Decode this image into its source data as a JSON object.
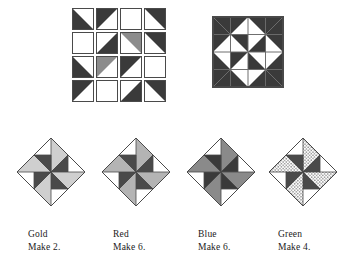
{
  "figure": {
    "type": "quilt-block-assembly-diagram",
    "colors": {
      "dark": "#3a3a3a",
      "mid_gray": "#8c8c8c",
      "light_gray": "#c9c9c9",
      "white": "#ffffff",
      "outline": "#4a4a4a",
      "text": "#1a1a1a",
      "stipple_dot": "#555555"
    }
  },
  "hst_grid": {
    "rows": 4,
    "cols": 4,
    "legend": {
      "dark": "dark fabric half-square triangle",
      "gray": "medium fabric half-square triangle",
      "white": "background / plain square"
    },
    "cells": [
      {
        "fill": "dark",
        "corner": "bottom-left"
      },
      {
        "fill": "dark",
        "corner": "top-left"
      },
      {
        "fill": "white",
        "corner": "none"
      },
      {
        "fill": "dark",
        "corner": "top-right"
      },
      {
        "fill": "white",
        "corner": "none"
      },
      {
        "fill": "dark",
        "corner": "bottom-right"
      },
      {
        "fill": "gray",
        "corner": "top-right"
      },
      {
        "fill": "dark",
        "corner": "top-right"
      },
      {
        "fill": "dark",
        "corner": "bottom-left"
      },
      {
        "fill": "gray",
        "corner": "top-left"
      },
      {
        "fill": "dark",
        "corner": "top-left"
      },
      {
        "fill": "white",
        "corner": "none"
      },
      {
        "fill": "dark",
        "corner": "top-left"
      },
      {
        "fill": "white",
        "corner": "none"
      },
      {
        "fill": "dark",
        "corner": "bottom-right"
      },
      {
        "fill": "dark",
        "corner": "top-right"
      }
    ]
  },
  "pinwheel_block": {
    "name": "assembled-pinwheel-block",
    "grid": "4x4 half-square-triangle units joined into a rotating pinwheel / broken-dishes block",
    "blades": 8,
    "blade_fill": "dark",
    "background_fill": "white"
  },
  "diamond_blocks": [
    {
      "id": "gold",
      "color_label": "Gold",
      "make_label": "Make 2.",
      "blade_light": "#cfcfcf",
      "blade_dark": "#4a4a4a",
      "texture": "solid",
      "blades": 4
    },
    {
      "id": "red",
      "color_label": "Red",
      "make_label": "Make 6.",
      "blade_light": "#b4b4b4",
      "blade_dark": "#4a4a4a",
      "texture": "solid",
      "blades": 4
    },
    {
      "id": "blue",
      "color_label": "Blue",
      "make_label": "Make 6.",
      "blade_light": "#8a8a8a",
      "blade_dark": "#3a3a3a",
      "texture": "solid",
      "blades": 4
    },
    {
      "id": "green",
      "color_label": "Green",
      "make_label": "Make 4.",
      "blade_light": "#d8d8d8",
      "blade_dark": "#4a4a4a",
      "texture": "stipple",
      "blades": 4
    }
  ]
}
